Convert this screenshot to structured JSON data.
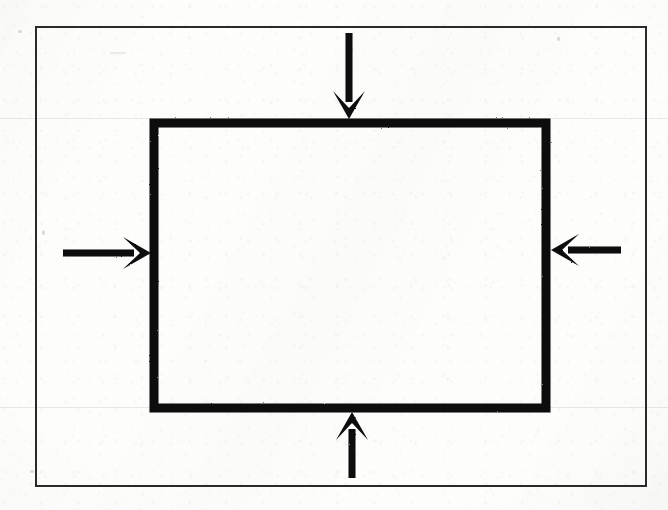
{
  "document": {
    "kind": "scanned-hand-drawn-diagram",
    "medium": "photocopied paper",
    "page_width": 668,
    "page_height": 510,
    "paper_color": "#fdfdfc",
    "ink_color": "#0d0d0d",
    "outer_frame_color": "#2a2a2a",
    "rule_line_color": "#7878871f",
    "text_labels": []
  },
  "figure": {
    "title": "",
    "caption": "",
    "outer_frame": {
      "name": "figure-border",
      "x": 36,
      "y": 27,
      "width": 610,
      "height": 459,
      "stroke_width": 2,
      "fill": "none"
    },
    "body_rect": {
      "name": "loaded-rectangle",
      "x": 154,
      "y": 123,
      "width": 392,
      "height": 285,
      "stroke_width": 9,
      "fill": "none"
    },
    "arrows": [
      {
        "name": "arrow-top",
        "direction": "down",
        "label": "",
        "tail_x": 349,
        "tail_y": 33,
        "tip_x": 349,
        "tip_y": 119,
        "shaft_width": 7,
        "head_length": 28,
        "head_half_width": 16,
        "barb_inset": 11
      },
      {
        "name": "arrow-left",
        "direction": "right",
        "label": "",
        "tail_x": 63,
        "tail_y": 253,
        "tip_x": 151,
        "tip_y": 253,
        "shaft_width": 7,
        "head_length": 28,
        "head_half_width": 16,
        "barb_inset": 11
      },
      {
        "name": "arrow-right",
        "direction": "left",
        "label": "",
        "tail_x": 621,
        "tail_y": 250,
        "tip_x": 551,
        "tip_y": 250,
        "shaft_width": 7,
        "head_length": 28,
        "head_half_width": 16,
        "barb_inset": 11
      },
      {
        "name": "arrow-bottom",
        "direction": "up",
        "label": "",
        "tail_x": 352,
        "tail_y": 478,
        "tip_x": 352,
        "tip_y": 412,
        "shaft_width": 7,
        "head_length": 28,
        "head_half_width": 16,
        "barb_inset": 11
      }
    ]
  }
}
